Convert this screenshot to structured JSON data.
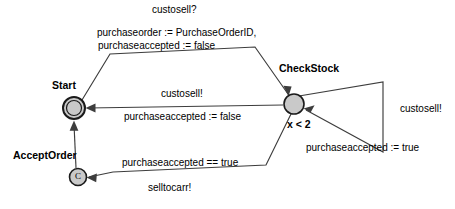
{
  "diagram": {
    "type": "state-machine-diagram",
    "title": "",
    "colors": {
      "node_fill": "#c9c9c9",
      "node_stroke": "#1a1a1a",
      "edge_stroke": "#3d3d3d",
      "background": "#ffffff",
      "text": "#000000"
    },
    "nodes": [
      {
        "id": "start",
        "label": "Start",
        "shape": "double-circle",
        "cx": 74,
        "cy": 108,
        "r_outer": 11,
        "r_inner": 7.5,
        "inner_text": ""
      },
      {
        "id": "check_stock",
        "label": "CheckStock",
        "shape": "circle",
        "cx": 294,
        "cy": 104,
        "r_outer": 10,
        "r_inner": 0,
        "inner_text": "",
        "guard": "x < 2"
      },
      {
        "id": "accept_order",
        "label": "AcceptOrder",
        "shape": "circle",
        "cx": 78,
        "cy": 177,
        "r_outer": 8.5,
        "r_inner": 0,
        "inner_text": "C"
      }
    ],
    "transitions": [
      {
        "id": "start-to-checkstock",
        "from": "start",
        "to": "check_stock",
        "event": "custosell?",
        "actions": [
          "purchaseorder := PurchaseOrderID,",
          "purchaseaccepted := false"
        ]
      },
      {
        "id": "checkstock-to-start",
        "from": "check_stock",
        "to": "start",
        "event": "custosell!",
        "actions": [
          "purchaseaccepted := false"
        ]
      },
      {
        "id": "checkstock-self-loop",
        "from": "check_stock",
        "to": "check_stock",
        "event": "custosell!",
        "actions": [
          "purchaseaccepted := true"
        ]
      },
      {
        "id": "checkstock-to-acceptorder",
        "from": "check_stock",
        "to": "accept_order",
        "guard": "purchaseaccepted == true",
        "event": "selltocarr!",
        "actions": []
      },
      {
        "id": "acceptorder-to-start",
        "from": "accept_order",
        "to": "start",
        "event": "",
        "actions": []
      }
    ],
    "labels": {
      "custosell_receive": "custosell?",
      "purchaseorder_assign": "purchaseorder := PurchaseOrderID,",
      "purchaseaccepted_false_top": "purchaseaccepted := false",
      "custosell_send_mid": "custosell!",
      "purchaseaccepted_false_mid": "purchaseaccepted := false",
      "custosell_send_loop": "custosell!",
      "purchaseaccepted_true_loop": "purchaseaccepted := true",
      "purchaseaccepted_eq_true": "purchaseaccepted == true",
      "selltocarr_send": "selltocarr!",
      "start_name": "Start",
      "checkstock_name": "CheckStock",
      "acceptorder_name": "AcceptOrder",
      "checkstock_guard": "x < 2",
      "acceptorder_inner": "C"
    }
  }
}
